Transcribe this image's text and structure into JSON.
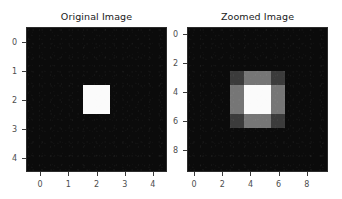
{
  "figure": {
    "background_color": "#ffffff",
    "width": 342,
    "height": 199
  },
  "chart_data": [
    {
      "type": "heatmap",
      "title": "Original Image",
      "xlabel": "",
      "ylabel": "",
      "grid": false,
      "legend": "none",
      "colormap": "gray",
      "vmin": 0,
      "vmax": 1,
      "xlim": [
        -0.5,
        4.5
      ],
      "ylim": [
        4.5,
        -0.5
      ],
      "xticks": [
        0,
        1,
        2,
        3,
        4
      ],
      "yticks": [
        0,
        1,
        2,
        3,
        4
      ],
      "xticklabels": [
        "0",
        "1",
        "2",
        "3",
        "4"
      ],
      "yticklabels": [
        "0",
        "1",
        "2",
        "3",
        "4"
      ],
      "shape": [
        5,
        5
      ],
      "values": [
        [
          0,
          0,
          0,
          0,
          0
        ],
        [
          0,
          0,
          0,
          0,
          0
        ],
        [
          0,
          0,
          1,
          0,
          0
        ],
        [
          0,
          0,
          0,
          0,
          0
        ],
        [
          0,
          0,
          0,
          0,
          0
        ]
      ],
      "colors": [
        [
          "#0b0b0b",
          "#0b0b0b",
          "#0b0b0b",
          "#0b0b0b",
          "#0b0b0b"
        ],
        [
          "#0b0b0b",
          "#0b0b0b",
          "#0b0b0b",
          "#0b0b0b",
          "#0b0b0b"
        ],
        [
          "#0b0b0b",
          "#0b0b0b",
          "#fbfbfb",
          "#0b0b0b",
          "#0b0b0b"
        ],
        [
          "#0b0b0b",
          "#0b0b0b",
          "#0b0b0b",
          "#0b0b0b",
          "#0b0b0b"
        ],
        [
          "#0b0b0b",
          "#0b0b0b",
          "#0b0b0b",
          "#0b0b0b",
          "#0b0b0b"
        ]
      ]
    },
    {
      "type": "heatmap",
      "title": "Zoomed Image",
      "xlabel": "",
      "ylabel": "",
      "grid": false,
      "legend": "none",
      "colormap": "gray",
      "vmin": 0,
      "vmax": 1,
      "xlim": [
        -0.5,
        9.5
      ],
      "ylim": [
        9.5,
        -0.5
      ],
      "xticks": [
        0,
        2,
        4,
        6,
        8
      ],
      "yticks": [
        0,
        2,
        4,
        6,
        8
      ],
      "xticklabels": [
        "0",
        "2",
        "4",
        "6",
        "8"
      ],
      "yticklabels": [
        "0",
        "2",
        "4",
        "6",
        "8"
      ],
      "shape": [
        10,
        10
      ],
      "values": [
        [
          0,
          0,
          0,
          0,
          0,
          0,
          0,
          0,
          0,
          0
        ],
        [
          0,
          0,
          0,
          0,
          0,
          0,
          0,
          0,
          0,
          0
        ],
        [
          0,
          0,
          0,
          0,
          0,
          0,
          0,
          0,
          0,
          0
        ],
        [
          0,
          0,
          0,
          0.25,
          0.5,
          0.5,
          0.25,
          0,
          0,
          0
        ],
        [
          0,
          0,
          0,
          0.5,
          1,
          1,
          0.5,
          0,
          0,
          0
        ],
        [
          0,
          0,
          0,
          0.5,
          1,
          1,
          0.5,
          0,
          0,
          0
        ],
        [
          0,
          0,
          0,
          0.25,
          0.5,
          0.5,
          0.25,
          0,
          0,
          0
        ],
        [
          0,
          0,
          0,
          0,
          0,
          0,
          0,
          0,
          0,
          0
        ],
        [
          0,
          0,
          0,
          0,
          0,
          0,
          0,
          0,
          0,
          0
        ],
        [
          0,
          0,
          0,
          0,
          0,
          0,
          0,
          0,
          0,
          0
        ]
      ],
      "colors": [
        [
          "#0b0b0b",
          "#0b0b0b",
          "#0b0b0b",
          "#0b0b0b",
          "#0b0b0b",
          "#0b0b0b",
          "#0b0b0b",
          "#0b0b0b",
          "#0b0b0b",
          "#0b0b0b"
        ],
        [
          "#0b0b0b",
          "#0b0b0b",
          "#0b0b0b",
          "#0b0b0b",
          "#0b0b0b",
          "#0b0b0b",
          "#0b0b0b",
          "#0b0b0b",
          "#0b0b0b",
          "#0b0b0b"
        ],
        [
          "#0b0b0b",
          "#0b0b0b",
          "#0b0b0b",
          "#0b0b0b",
          "#0b0b0b",
          "#0b0b0b",
          "#0b0b0b",
          "#0b0b0b",
          "#0b0b0b",
          "#0b0b0b"
        ],
        [
          "#0b0b0b",
          "#0b0b0b",
          "#0b0b0b",
          "#3b3b3b",
          "#767676",
          "#767676",
          "#3b3b3b",
          "#0b0b0b",
          "#0b0b0b",
          "#0b0b0b"
        ],
        [
          "#0b0b0b",
          "#0b0b0b",
          "#0b0b0b",
          "#767676",
          "#fbfbfb",
          "#fbfbfb",
          "#767676",
          "#0b0b0b",
          "#0b0b0b",
          "#0b0b0b"
        ],
        [
          "#0b0b0b",
          "#0b0b0b",
          "#0b0b0b",
          "#767676",
          "#fbfbfb",
          "#fbfbfb",
          "#767676",
          "#0b0b0b",
          "#0b0b0b",
          "#0b0b0b"
        ],
        [
          "#0b0b0b",
          "#0b0b0b",
          "#0b0b0b",
          "#3b3b3b",
          "#767676",
          "#767676",
          "#3b3b3b",
          "#0b0b0b",
          "#0b0b0b",
          "#0b0b0b"
        ],
        [
          "#0b0b0b",
          "#0b0b0b",
          "#0b0b0b",
          "#0b0b0b",
          "#0b0b0b",
          "#0b0b0b",
          "#0b0b0b",
          "#0b0b0b",
          "#0b0b0b",
          "#0b0b0b"
        ],
        [
          "#0b0b0b",
          "#0b0b0b",
          "#0b0b0b",
          "#0b0b0b",
          "#0b0b0b",
          "#0b0b0b",
          "#0b0b0b",
          "#0b0b0b",
          "#0b0b0b",
          "#0b0b0b"
        ],
        [
          "#0b0b0b",
          "#0b0b0b",
          "#0b0b0b",
          "#0b0b0b",
          "#0b0b0b",
          "#0b0b0b",
          "#0b0b0b",
          "#0b0b0b",
          "#0b0b0b",
          "#0b0b0b"
        ]
      ]
    }
  ]
}
